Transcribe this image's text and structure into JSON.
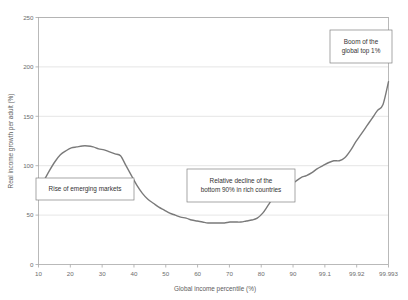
{
  "chart_data": {
    "type": "line",
    "title": "",
    "xlabel": "Global income  percentile (%)",
    "ylabel": "Real income growth per adult (%)",
    "xticklabels": [
      "10",
      "20",
      "30",
      "40",
      "50",
      "60",
      "70",
      "80",
      "90",
      "99.1",
      "99.92",
      "99.993"
    ],
    "yticklabels": [
      "0",
      "50",
      "100",
      "150",
      "200",
      "250"
    ],
    "ylim": [
      0,
      250
    ],
    "grid": true,
    "legend": "none",
    "series": [
      {
        "name": "Real income growth per adult",
        "x_positions": [
          0,
          1,
          2,
          3,
          4,
          5,
          6,
          7,
          8,
          9,
          10,
          11,
          12,
          13,
          14,
          15,
          16,
          17,
          18,
          19,
          20,
          21,
          22,
          23,
          24,
          25,
          26,
          27,
          28,
          29,
          30,
          31,
          32,
          33,
          34,
          35,
          36,
          37,
          38,
          39,
          40,
          41,
          42,
          43,
          44,
          45,
          46,
          47,
          48,
          49,
          50,
          51,
          52,
          53,
          54,
          55,
          56,
          57,
          58,
          59,
          60,
          61,
          62,
          63,
          64
        ],
        "x_labels": [
          "10",
          "12",
          "14",
          "16",
          "18",
          "20",
          "22",
          "24",
          "26",
          "28",
          "30",
          "32",
          "34",
          "36",
          "38",
          "40",
          "42",
          "44",
          "46",
          "48",
          "50",
          "52",
          "54",
          "56",
          "58",
          "60",
          "62",
          "64",
          "66",
          "68",
          "70",
          "72",
          "74",
          "76",
          "78",
          "80",
          "82",
          "84",
          "86",
          "88",
          "90",
          "92",
          "94",
          "95",
          "96",
          "97",
          "98",
          "99",
          "99.1",
          "99.2",
          "99.4",
          "99.6",
          "99.8",
          "99.9",
          "99.92",
          "99.94",
          "99.96",
          "99.97",
          "99.98",
          "99.99",
          "99.993",
          "99.995",
          "99.997",
          "99.999",
          "100"
        ],
        "values": [
          76,
          85,
          95,
          104,
          111,
          115,
          118,
          119,
          120,
          120,
          119,
          117,
          116,
          114,
          112,
          110,
          100,
          90,
          80,
          72,
          66,
          62,
          58,
          55,
          52,
          50,
          48,
          47,
          45,
          44,
          43,
          42,
          42,
          42,
          42,
          43,
          43,
          43,
          44,
          45,
          47,
          52,
          60,
          68,
          72,
          76,
          80,
          84,
          88,
          90,
          93,
          97,
          100,
          103,
          105,
          105,
          108,
          115,
          124,
          132,
          140,
          148,
          156,
          162,
          185
        ]
      }
    ],
    "annotations": [
      {
        "id": "rise-of-emerging-markets",
        "lines": [
          "Rise of emerging markets"
        ],
        "box": {
          "x": 36,
          "y": 178,
          "w": 98,
          "h": 22
        }
      },
      {
        "id": "relative-decline",
        "lines": [
          "Relative decline of the",
          "bottom 90% in rich countries"
        ],
        "box": {
          "x": 187,
          "y": 169,
          "w": 108,
          "h": 33
        }
      },
      {
        "id": "boom-of-global-top-1",
        "lines": [
          "Boom of the",
          "global top 1%"
        ],
        "box": {
          "x": 330,
          "y": 30,
          "w": 62,
          "h": 33
        }
      }
    ],
    "colors": {
      "series_line": "#7a7a7a",
      "gridline": "#d4d4d4",
      "axis": "#9a9a9a",
      "text": "#5c5c5c",
      "background": "#ffffff"
    }
  }
}
